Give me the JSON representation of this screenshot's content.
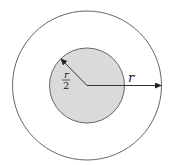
{
  "diagram": {
    "outer_circle": {
      "label": "r",
      "fill": "#ffffff",
      "stroke": "#555555"
    },
    "inner_circle": {
      "label_numerator": "r",
      "label_denominator": "2",
      "fill": "#d9d9d9",
      "stroke": "#555555"
    },
    "colors": {
      "line": "#333333"
    }
  }
}
